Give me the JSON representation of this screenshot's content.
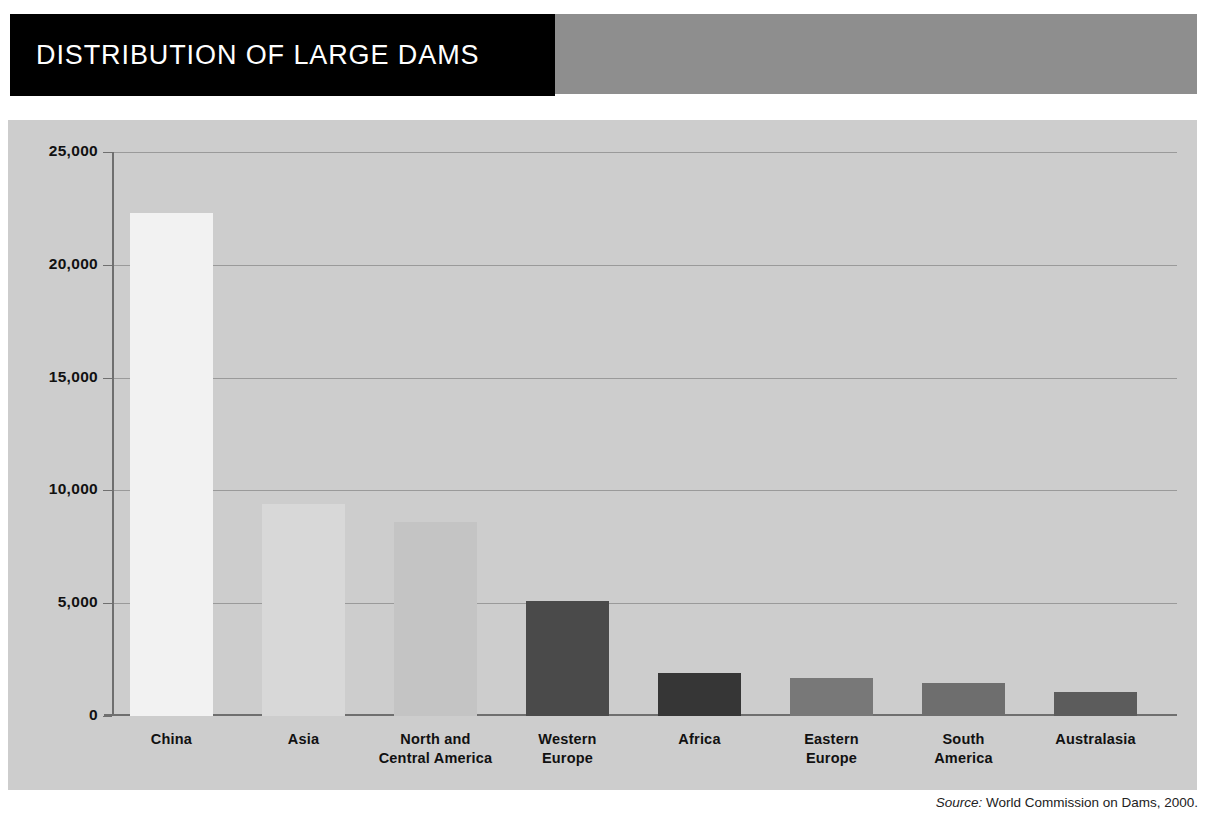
{
  "header": {
    "title": "DISTRIBUTION OF LARGE DAMS",
    "title_bg": "#000000",
    "band_bg": "#8e8e8e"
  },
  "source": {
    "label": "Source:",
    "text": "World Commission on Dams, 2000."
  },
  "panel": {
    "background": "#cdcdcd",
    "gridline_color": "#9a9a9a",
    "axis_color": "#6f6f6f"
  },
  "chart_data": {
    "type": "bar",
    "title": "DISTRIBUTION OF LARGE DAMS",
    "xlabel": "",
    "ylabel": "",
    "ylim": [
      0,
      25000
    ],
    "yticks": [
      0,
      5000,
      10000,
      15000,
      20000,
      25000
    ],
    "ytick_labels": [
      "0",
      "5,000",
      "10,000",
      "15,000",
      "20,000",
      "25,000"
    ],
    "grid": true,
    "legend": "none",
    "categories": [
      "China",
      "Asia",
      "North and Central America",
      "Western Europe",
      "Africa",
      "Eastern Europe",
      "South America",
      "Australasia"
    ],
    "category_lines": [
      [
        "China"
      ],
      [
        "Asia"
      ],
      [
        "North and",
        "Central America"
      ],
      [
        "Western",
        "Europe"
      ],
      [
        "Africa"
      ],
      [
        "Eastern",
        "Europe"
      ],
      [
        "South",
        "America"
      ],
      [
        "Australasia"
      ]
    ],
    "values": [
      22300,
      9400,
      8600,
      5100,
      1900,
      1700,
      1450,
      1050
    ],
    "bar_colors": [
      "#f2f2f2",
      "#d8d8d8",
      "#c4c4c4",
      "#4a4a4a",
      "#363636",
      "#787878",
      "#6e6e6e",
      "#5c5c5c"
    ]
  }
}
